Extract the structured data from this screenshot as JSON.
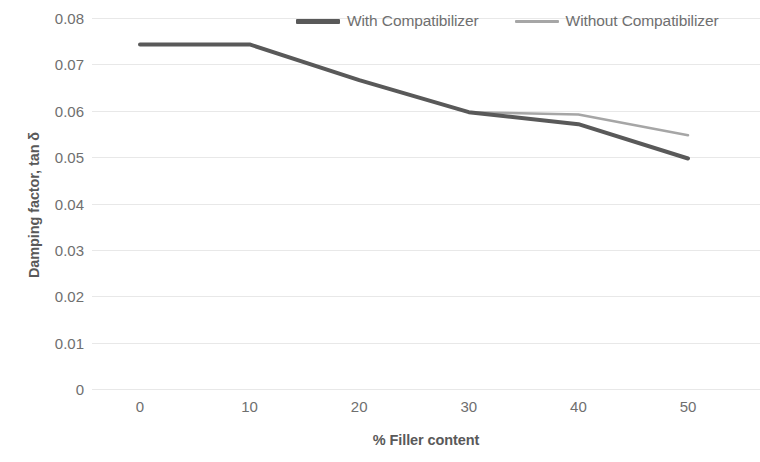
{
  "chart_data": {
    "type": "line",
    "title": "",
    "xlabel": "% Filler content",
    "ylabel": "Damping factor, tan δ",
    "x": [
      0,
      10,
      20,
      30,
      40,
      50
    ],
    "xtick_labels": [
      "0",
      "10",
      "20",
      "30",
      "40",
      "50"
    ],
    "xlim": [
      0,
      50
    ],
    "ylim": [
      0,
      0.08
    ],
    "ytick_labels": [
      "0",
      "0.01",
      "0.02",
      "0.03",
      "0.04",
      "0.05",
      "0.06",
      "0.07",
      "0.08"
    ],
    "ytick_values": [
      0,
      0.01,
      0.02,
      0.03,
      0.04,
      0.05,
      0.06,
      0.07,
      0.08
    ],
    "grid": true,
    "grid_axis": "y",
    "legend_position": "top",
    "series": [
      {
        "name": "With Compatibilizer",
        "color": "#595959",
        "width": 4,
        "values": [
          0.0743,
          0.0743,
          0.0666,
          0.0597,
          0.0571,
          0.0497
        ]
      },
      {
        "name": "Without Compatibilizer",
        "color": "#a6a6a6",
        "width": 2.5,
        "values": [
          0.0743,
          0.0743,
          0.0666,
          0.0597,
          0.0592,
          0.0547
        ]
      }
    ]
  },
  "legend": {
    "entries": [
      {
        "label": "With Compatibilizer"
      },
      {
        "label": "Without Compatibilizer"
      }
    ]
  },
  "colors": {
    "with_compatibilizer": "#595959",
    "without_compatibilizer": "#a6a6a6",
    "gridline": "#e8e8e8",
    "text": "#6f6f6f",
    "background": "#ffffff"
  }
}
